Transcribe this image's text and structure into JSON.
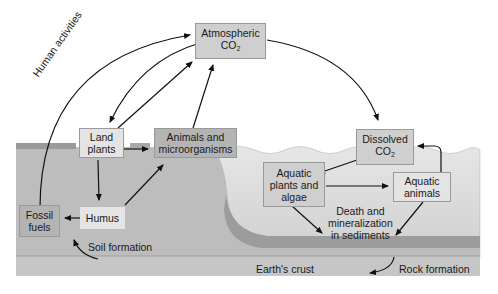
{
  "diagram": {
    "nodes": {
      "atmospheric_co2": {
        "line1": "Atmospheric",
        "line2": "CO",
        "sub": "2"
      },
      "land_plants": {
        "line1": "Land",
        "line2": "plants"
      },
      "animals_micro": {
        "line1": "Animals and",
        "line2": "microorganisms"
      },
      "humus": {
        "label": "Humus"
      },
      "fossil_fuels": {
        "line1": "Fossil",
        "line2": "fuels"
      },
      "dissolved_co2": {
        "line1": "Dissolved",
        "line2": "CO",
        "sub": "2"
      },
      "aquatic_plants": {
        "line1": "Aquatic",
        "line2": "plants and",
        "line3": "algae"
      },
      "aquatic_animals": {
        "line1": "Aquatic",
        "line2": "animals"
      }
    },
    "labels": {
      "human_activities": "Human activities",
      "soil_formation": "Soil formation",
      "death_line1": "Death and",
      "death_line2": "mineralization",
      "death_line3": "in sediments",
      "earths_crust": "Earth's crust",
      "rock_formation": "Rock formation"
    },
    "colors": {
      "soil": "#b9b9b9",
      "water": "#d9d9d9",
      "sediment": "#9e9e9e",
      "crust": "#c4c4c4",
      "arrow": "#111111"
    }
  }
}
